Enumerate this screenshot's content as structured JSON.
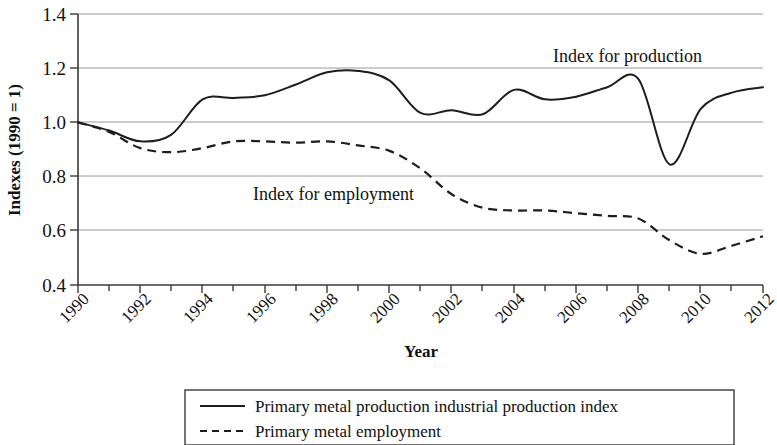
{
  "chart_data": {
    "type": "line",
    "title": "",
    "xlabel": "Year",
    "ylabel": "Indexes (1990 = 1)",
    "xlim": [
      1990,
      2012
    ],
    "ylim": [
      0.4,
      1.4
    ],
    "grid": true,
    "legend_position": "below-plot",
    "x_tick_labels": [
      "1990",
      "1992",
      "1994",
      "1996",
      "1998",
      "2000",
      "2002",
      "2004",
      "2006",
      "2008",
      "2010",
      "2012"
    ],
    "y_tick_labels": [
      "0.4",
      "0.6",
      "0.8",
      "1.0",
      "1.2",
      "1.4"
    ],
    "x": [
      1990,
      1991,
      1992,
      1993,
      1994,
      1995,
      1996,
      1997,
      1998,
      1999,
      2000,
      2001,
      2002,
      2003,
      2004,
      2005,
      2006,
      2007,
      2008,
      2009,
      2010,
      2011,
      2012
    ],
    "series": [
      {
        "name": "Primary metal production industrial production index",
        "style": "solid",
        "annotation": "Index for production",
        "values": [
          1.0,
          0.97,
          0.93,
          0.955,
          1.085,
          1.09,
          1.1,
          1.14,
          1.185,
          1.19,
          1.155,
          1.035,
          1.045,
          1.03,
          1.12,
          1.085,
          1.095,
          1.13,
          1.16,
          0.845,
          1.05,
          1.11,
          1.13
        ]
      },
      {
        "name": "Primary metal employment",
        "style": "dashed",
        "annotation": "Index for employment",
        "values": [
          1.0,
          0.965,
          0.905,
          0.89,
          0.905,
          0.93,
          0.93,
          0.925,
          0.93,
          0.915,
          0.895,
          0.83,
          0.735,
          0.685,
          0.675,
          0.675,
          0.665,
          0.655,
          0.645,
          0.565,
          0.515,
          0.545,
          0.58
        ]
      }
    ],
    "annotations": [
      {
        "text": "Index for production",
        "x": 1998.8,
        "y": 1.275
      },
      {
        "text": "Index for employment",
        "x": 1995.6,
        "y": 0.755
      }
    ],
    "legend": [
      {
        "label": "Primary metal production industrial production index",
        "style": "solid"
      },
      {
        "label": "Primary metal employment",
        "style": "dashed"
      }
    ]
  }
}
